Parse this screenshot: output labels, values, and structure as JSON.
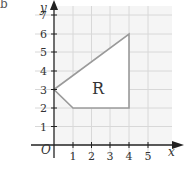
{
  "part_label": "b",
  "diagram": {
    "type": "coordinate-grid-polygon",
    "x_axis": {
      "label": "x",
      "ticks": [
        "1",
        "2",
        "3",
        "4",
        "5"
      ],
      "range": [
        0,
        5
      ]
    },
    "y_axis": {
      "label": "y",
      "ticks": [
        "1",
        "2",
        "3",
        "4",
        "5",
        "6",
        "7"
      ],
      "range": [
        0,
        7
      ]
    },
    "origin_label": "O",
    "region": {
      "label": "R",
      "vertices": [
        [
          0,
          3
        ],
        [
          4,
          6
        ],
        [
          4,
          2
        ],
        [
          1,
          2
        ]
      ]
    },
    "colors": {
      "grid": "#d8d8d8",
      "axis": "#222222",
      "polygon_edge": "#9a9a9a",
      "region_fill": "#ffffff",
      "background": "#f5f5f5"
    }
  }
}
